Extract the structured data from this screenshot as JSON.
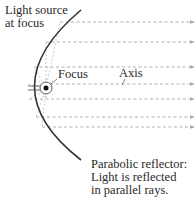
{
  "labels": {
    "light_source_line1": "Light source",
    "light_source_line2": "at focus",
    "focus": "Focus",
    "axis": "Axis",
    "caption_line1": "Parabolic reflector:",
    "caption_line2": "Light is reflected",
    "caption_line3": "in parallel rays."
  },
  "colors": {
    "reflector": "#333333",
    "rays": "#a8a8a8",
    "text": "#2a2a2a",
    "background": "#ffffff"
  },
  "geometry": {
    "focus": [
      46,
      88
    ],
    "vertex": [
      27,
      88
    ],
    "ray_y": [
      22,
      42,
      67,
      84,
      99,
      117,
      127
    ],
    "ray_end_x": 194
  }
}
